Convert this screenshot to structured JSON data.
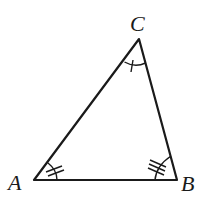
{
  "diagram": {
    "type": "triangle",
    "vertices": {
      "A": {
        "label": "A",
        "x": 34,
        "y": 180
      },
      "B": {
        "label": "B",
        "x": 177,
        "y": 180
      },
      "C": {
        "label": "C",
        "x": 139,
        "y": 39
      }
    },
    "angle_marks": {
      "A": {
        "arcs": 1,
        "ticks": 2
      },
      "B": {
        "arcs": 1,
        "ticks": 3
      },
      "C": {
        "arcs": 1,
        "ticks": 1
      }
    },
    "colors": {
      "stroke": "#1a1a1a",
      "background": "#ffffff"
    }
  }
}
